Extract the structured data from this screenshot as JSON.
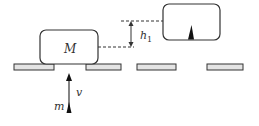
{
  "diagram": {
    "labels": {
      "big_mass": "M",
      "small_mass": "m",
      "velocity": "v",
      "height": "h",
      "height_sub": "1"
    },
    "colors": {
      "stroke": "#333333",
      "platform_fill": "#e4e4e4",
      "background": "#ffffff"
    },
    "elements": [
      {
        "type": "box",
        "label": "M",
        "position": "left, resting on gap"
      },
      {
        "type": "box",
        "label": "",
        "position": "raised right, with small spike inside"
      },
      {
        "type": "platforms",
        "count": 4
      },
      {
        "type": "arrow",
        "direction": "up",
        "label": "v",
        "object": "m"
      },
      {
        "type": "dimension",
        "label": "h1"
      }
    ]
  }
}
